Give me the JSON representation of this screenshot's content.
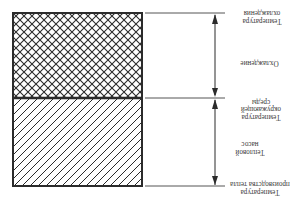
{
  "diagram": {
    "orientation": "rotated-180",
    "regions": [
      {
        "name": "cooling-region",
        "pattern": "crosshatch"
      },
      {
        "name": "heat-pump-region",
        "pattern": "diagonal-hatch"
      }
    ],
    "labels": {
      "cooling_temperature": [
        "Температура",
        "охлаждения"
      ],
      "cooling": "Охлаждение",
      "ambient_temperature": [
        "Температура",
        "окружающей",
        "среды"
      ],
      "heat_pump": [
        "Тепловой",
        "насос"
      ],
      "heat_production_temperature": [
        "Температура",
        "производства тепла"
      ]
    },
    "colors": {
      "stroke": "#2b2b2b",
      "text": "#3a3a3a",
      "background": "#ffffff"
    }
  }
}
